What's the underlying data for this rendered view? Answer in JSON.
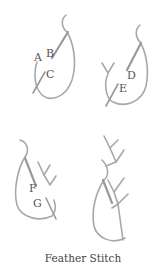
{
  "title": "Feather Stitch",
  "colors": {
    "thread": "#a8a8a8",
    "needle": "#9a9a9a",
    "label": "#555555",
    "background": "#ffffff"
  },
  "panels": [
    {
      "id": "step1",
      "labels": [
        "A",
        "B",
        "C"
      ]
    },
    {
      "id": "step2",
      "labels": [
        "D",
        "E"
      ]
    },
    {
      "id": "step3",
      "labels": [
        "F",
        "G"
      ]
    },
    {
      "id": "step4",
      "labels": []
    }
  ],
  "labels": {
    "A": "A",
    "B": "B",
    "C": "C",
    "D": "D",
    "E": "E",
    "F": "F",
    "G": "G"
  }
}
